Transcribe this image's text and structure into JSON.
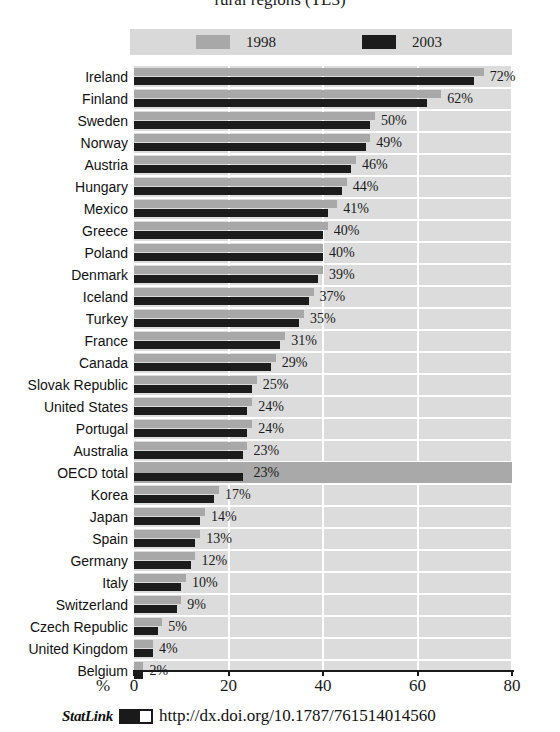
{
  "title": "rural regions (TL3)",
  "legend": {
    "items": [
      {
        "label": "1998",
        "color": "#a8a8a8",
        "icon": "legend-swatch-1998"
      },
      {
        "label": "2003",
        "color": "#1c1c1c",
        "icon": "legend-swatch-2003"
      }
    ]
  },
  "axis": {
    "percent_symbol": "%",
    "ticks": [
      "0",
      "20",
      "40",
      "60",
      "80"
    ]
  },
  "statlink": {
    "word": "StatLink",
    "logo": "statlink-icon",
    "url": "http://dx.doi.org/10.1787/761514014560"
  },
  "highlight_row": "OECD total",
  "chart_data": {
    "type": "bar",
    "orientation": "horizontal",
    "title": "rural regions (TL3)",
    "xlabel": "%",
    "ylabel": "",
    "xlim": [
      0,
      80
    ],
    "grid": true,
    "legend_position": "top",
    "categories": [
      "Ireland",
      "Finland",
      "Sweden",
      "Norway",
      "Austria",
      "Hungary",
      "Mexico",
      "Greece",
      "Poland",
      "Denmark",
      "Iceland",
      "Turkey",
      "France",
      "Canada",
      "Slovak Republic",
      "United States",
      "Portugal",
      "Australia",
      "OECD total",
      "Korea",
      "Japan",
      "Spain",
      "Germany",
      "Italy",
      "Switzerland",
      "Czech Republic",
      "United Kingdom",
      "Belgium"
    ],
    "series": [
      {
        "name": "1998",
        "color": "#a8a8a8",
        "values": [
          74,
          65,
          51,
          50,
          47,
          45,
          43,
          41,
          40,
          40,
          38,
          36,
          32,
          30,
          26,
          25,
          25,
          24,
          24,
          18,
          15,
          14,
          13,
          11,
          10,
          6,
          4,
          2
        ]
      },
      {
        "name": "2003",
        "color": "#1c1c1c",
        "values": [
          72,
          62,
          50,
          49,
          46,
          44,
          41,
          40,
          40,
          39,
          37,
          35,
          31,
          29,
          25,
          24,
          24,
          23,
          23,
          17,
          14,
          13,
          12,
          10,
          9,
          5,
          4,
          2
        ]
      }
    ],
    "data_labels": [
      "72%",
      "62%",
      "50%",
      "49%",
      "46%",
      "44%",
      "41%",
      "40%",
      "40%",
      "39%",
      "37%",
      "35%",
      "31%",
      "29%",
      "25%",
      "24%",
      "24%",
      "23%",
      "23%",
      "17%",
      "14%",
      "13%",
      "12%",
      "10%",
      "9%",
      "5%",
      "4%",
      "2%"
    ]
  }
}
